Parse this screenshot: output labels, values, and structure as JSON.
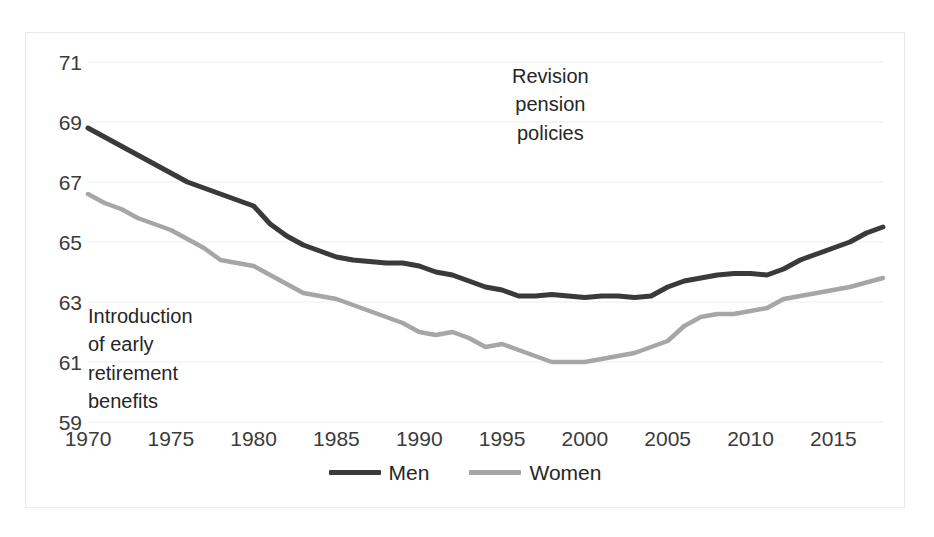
{
  "chart_data": {
    "type": "line",
    "title": "",
    "xlabel": "",
    "ylabel": "",
    "xlim": [
      1970,
      2018
    ],
    "ylim": [
      59,
      71
    ],
    "grid": true,
    "legend_position": "bottom",
    "y_ticks": [
      "71",
      "69",
      "67",
      "65",
      "63",
      "61",
      "59"
    ],
    "x_ticks": [
      "1970",
      "1975",
      "1980",
      "1985",
      "1990",
      "1995",
      "2000",
      "2005",
      "2010",
      "2015"
    ],
    "x": [
      1970,
      1971,
      1972,
      1973,
      1974,
      1975,
      1976,
      1977,
      1978,
      1979,
      1980,
      1981,
      1982,
      1983,
      1984,
      1985,
      1986,
      1987,
      1988,
      1989,
      1990,
      1991,
      1992,
      1993,
      1994,
      1995,
      1996,
      1997,
      1998,
      1999,
      2000,
      2001,
      2002,
      2003,
      2004,
      2005,
      2006,
      2007,
      2008,
      2009,
      2010,
      2011,
      2012,
      2013,
      2014,
      2015,
      2016,
      2017,
      2018
    ],
    "series": [
      {
        "name": "Men",
        "color": "#3a3a3a",
        "values": [
          68.8,
          68.5,
          68.2,
          67.9,
          67.6,
          67.3,
          67.0,
          66.8,
          66.6,
          66.4,
          66.2,
          65.6,
          65.2,
          64.9,
          64.7,
          64.5,
          64.4,
          64.35,
          64.3,
          64.3,
          64.2,
          64.0,
          63.9,
          63.7,
          63.5,
          63.4,
          63.2,
          63.2,
          63.25,
          63.2,
          63.15,
          63.2,
          63.2,
          63.15,
          63.2,
          63.5,
          63.7,
          63.8,
          63.9,
          63.95,
          63.95,
          63.9,
          64.1,
          64.4,
          64.6,
          64.8,
          65.0,
          65.3,
          65.5
        ]
      },
      {
        "name": "Women",
        "color": "#a6a6a6",
        "values": [
          66.6,
          66.3,
          66.1,
          65.8,
          65.6,
          65.4,
          65.1,
          64.8,
          64.4,
          64.3,
          64.2,
          63.9,
          63.6,
          63.3,
          63.2,
          63.1,
          62.9,
          62.7,
          62.5,
          62.3,
          62.0,
          61.9,
          62.0,
          61.8,
          61.5,
          61.6,
          61.4,
          61.2,
          61.0,
          61.0,
          61.0,
          61.1,
          61.2,
          61.3,
          61.5,
          61.7,
          62.2,
          62.5,
          62.6,
          62.6,
          62.7,
          62.8,
          63.1,
          63.2,
          63.3,
          63.4,
          63.5,
          63.65,
          63.8
        ]
      }
    ],
    "annotations": [
      {
        "id": "early-retirement",
        "text": "Introduction\nof early\nretirement\nbenefits"
      },
      {
        "id": "revision-pension",
        "text": "Revision\npension\npolicies"
      }
    ]
  },
  "legend": {
    "items": [
      {
        "label": "Men",
        "color": "#3a3a3a"
      },
      {
        "label": "Women",
        "color": "#a6a6a6"
      }
    ]
  }
}
